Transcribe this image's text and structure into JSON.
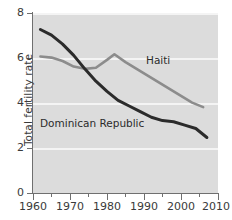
{
  "chart_data": {
    "type": "line",
    "title": "",
    "xlabel": "",
    "ylabel": "Total fertility rate",
    "xlim": [
      1960,
      2010
    ],
    "ylim": [
      0,
      8
    ],
    "grid": true,
    "legend_position": "inline-annotations",
    "xticks": [
      1960,
      1970,
      1980,
      1990,
      2000,
      2010
    ],
    "xtick_labels": [
      "1960",
      "1970",
      "1980",
      "1990",
      "2000",
      "2010"
    ],
    "xminor_ticks": [
      1965,
      1975,
      1985,
      1995,
      2005
    ],
    "yticks": [
      0,
      2,
      4,
      6,
      8
    ],
    "ytick_labels": [
      "0",
      "2",
      "4",
      "6",
      "8"
    ],
    "series": [
      {
        "name": "Haiti",
        "color": "#8c8c8c",
        "annotation": "Haiti",
        "x": [
          1962,
          1965,
          1968,
          1971,
          1974,
          1977,
          1980,
          1982,
          1985,
          1988,
          1991,
          1994,
          1997,
          2000,
          2003,
          2006
        ],
        "values": [
          6.05,
          6.0,
          5.85,
          5.6,
          5.5,
          5.55,
          5.9,
          6.15,
          5.8,
          5.5,
          5.2,
          4.9,
          4.6,
          4.3,
          4.0,
          3.8
        ]
      },
      {
        "name": "Dominican Republic",
        "color": "#2b2b2b",
        "annotation": "Dominican Republic",
        "x": [
          1962,
          1965,
          1968,
          1971,
          1974,
          1977,
          1980,
          1983,
          1986,
          1989,
          1992,
          1995,
          1998,
          2001,
          2004,
          2007
        ],
        "values": [
          7.25,
          7.0,
          6.6,
          6.1,
          5.5,
          4.95,
          4.5,
          4.1,
          3.85,
          3.6,
          3.35,
          3.2,
          3.15,
          3.0,
          2.85,
          2.45
        ]
      }
    ]
  },
  "axis": {
    "y_title": "Total fertility rate",
    "y_labels": [
      "8",
      "6",
      "4",
      "2",
      "0"
    ],
    "x_labels": [
      "1960",
      "1970",
      "1980",
      "1990",
      "2000",
      "2010"
    ]
  },
  "annotations": {
    "haiti": "Haiti",
    "dominican_republic": "Dominican Republic"
  },
  "colors": {
    "plot_background": "#dcdcdc",
    "gridline": "#f4f4f4",
    "axis": "#6f6f6f",
    "haiti_line": "#8c8c8c",
    "dominican_line": "#2b2b2b",
    "text": "#3a3a3a"
  }
}
